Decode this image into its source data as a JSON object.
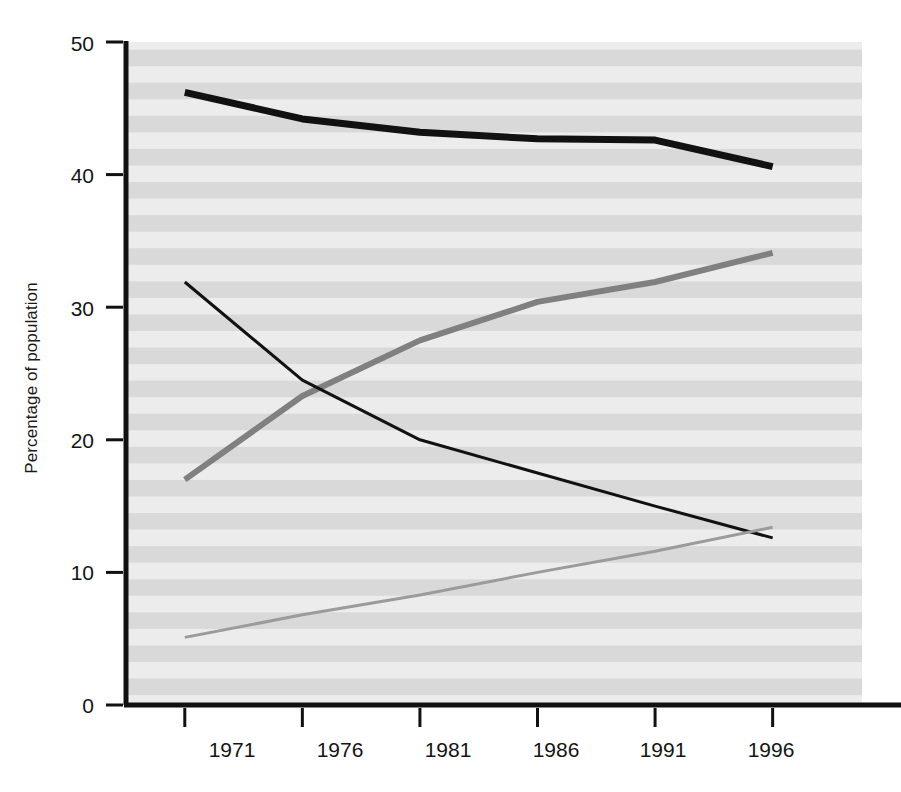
{
  "chart_data": {
    "type": "line",
    "title": "",
    "xlabel": "",
    "ylabel": "Percentage of population",
    "categories": [
      "1971",
      "1976",
      "1981",
      "1986",
      "1991",
      "1996"
    ],
    "x": [
      1971,
      1976,
      1981,
      1986,
      1991,
      1996
    ],
    "xlim": [
      1968.5,
      1999.8
    ],
    "ylim": [
      0,
      50
    ],
    "yticks": [
      0,
      10,
      20,
      30,
      40,
      50
    ],
    "ytick_labels": [
      "0",
      "10",
      "20",
      "30",
      "40",
      "50"
    ],
    "xticks": [
      1971,
      1976,
      1981,
      1986,
      1991,
      1996
    ],
    "xtick_labels": [
      "1971",
      "1976",
      "1981",
      "1986",
      "1991",
      "1996"
    ],
    "grid": false,
    "background_stripes": true,
    "legend_position": "inline-labels",
    "series": [
      {
        "name": "Grades 9–13",
        "values": [
          46.2,
          44.2,
          43.2,
          42.7,
          42.6,
          40.6
        ],
        "color": "#111111",
        "width": 7
      },
      {
        "name": "Some postsecondary",
        "values": [
          17.0,
          23.3,
          27.5,
          30.4,
          31.9,
          34.1
        ],
        "color": "#808080",
        "width": 6
      },
      {
        "name": "Less than grade 9",
        "values": [
          31.9,
          24.5,
          20.0,
          17.5,
          15.0,
          12.6
        ],
        "color": "#111111",
        "width": 3
      },
      {
        "name": "University degree",
        "values": [
          5.1,
          6.8,
          8.3,
          10.0,
          11.6,
          13.4
        ],
        "color": "#9b9b9b",
        "width": 3
      }
    ],
    "annotations": [
      {
        "text": "Grades 9–13",
        "x": 513,
        "y": 98
      },
      {
        "text": "Some postsecondary",
        "x": 505,
        "y": 255
      },
      {
        "text": "Less than grade 9",
        "x": 649,
        "y": 446
      },
      {
        "text": "University degree",
        "x": 624,
        "y": 610
      }
    ]
  },
  "axis": {
    "y_title": "Percentage of population",
    "y_labels": [
      "50",
      "40",
      "30",
      "20",
      "10",
      "0"
    ],
    "x_labels": [
      "1971",
      "1976",
      "1981",
      "1986",
      "1991",
      "1996"
    ]
  },
  "colors": {
    "axis": "#111111",
    "plot_bg_light": "#ebebeb",
    "plot_bg_dark": "#d8d8d8",
    "text": "#141414"
  }
}
